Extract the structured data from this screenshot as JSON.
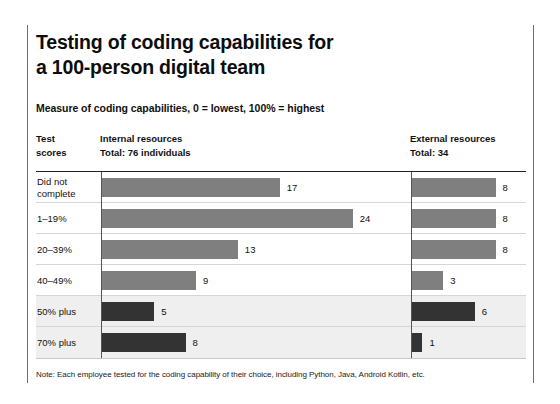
{
  "title": "Testing of coding capabilities for\na 100-person digital team",
  "subtitle": "Measure of coding capabilities, 0 = lowest, 100% = highest",
  "headers": {
    "scores": "Test\nscores",
    "internal": "Internal resources\nTotal: 76 individuals",
    "external": "External resources\nTotal: 34"
  },
  "footnote": "Note: Each employee tested for the coding capability of their choice, including Python, Java, Android Kotlin, etc.",
  "colors": {
    "bar_gray": "#7f7f7f",
    "bar_dark": "#333333",
    "row_shaded": "#efefef",
    "rule": "#222222"
  },
  "chart_data": {
    "type": "bar",
    "title": "Testing of coding capabilities for a 100-person digital team",
    "subtitle": "Measure of coding capabilities, 0 = lowest, 100% = highest",
    "xlabel": "",
    "ylabel": "Test scores",
    "orientation": "horizontal",
    "grid": false,
    "legend": "none",
    "xlim": [
      0,
      24
    ],
    "categories": [
      "Did not complete",
      "1–19%",
      "20–39%",
      "40–49%",
      "50% plus",
      "70% plus"
    ],
    "series": [
      {
        "name": "Internal resources",
        "total": 76,
        "values": [
          17,
          24,
          13,
          9,
          5,
          8
        ]
      },
      {
        "name": "External resources",
        "total": 34,
        "values": [
          8,
          8,
          8,
          3,
          6,
          1
        ]
      }
    ],
    "highlighted_categories": [
      "50% plus",
      "70% plus"
    ]
  },
  "rows": [
    {
      "label": "Did not\ncomplete",
      "internal": 17,
      "external": 8,
      "shaded": false,
      "dark": false
    },
    {
      "label": "1–19%",
      "internal": 24,
      "external": 8,
      "shaded": false,
      "dark": false
    },
    {
      "label": "20–39%",
      "internal": 13,
      "external": 8,
      "shaded": false,
      "dark": false
    },
    {
      "label": "40–49%",
      "internal": 9,
      "external": 3,
      "shaded": false,
      "dark": false
    },
    {
      "label": "50% plus",
      "internal": 5,
      "external": 6,
      "shaded": true,
      "dark": true
    },
    {
      "label": "70% plus",
      "internal": 8,
      "external": 1,
      "shaded": true,
      "dark": true
    }
  ]
}
